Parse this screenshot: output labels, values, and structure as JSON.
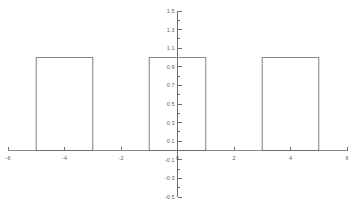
{
  "chart_data": {
    "type": "line",
    "title": "",
    "subtitle": "",
    "xlabel": "",
    "ylabel": "",
    "xlim": [
      -6,
      6
    ],
    "ylim": [
      -0.5,
      1.5
    ],
    "grid": false,
    "legend": null,
    "x_ticks": [
      -6,
      -4,
      -2,
      0,
      2,
      4,
      6
    ],
    "x_tick_labels": [
      "-6",
      "-4",
      "-2",
      "0",
      "2",
      "4",
      "6"
    ],
    "y_ticks": [
      -0.5,
      -0.3,
      -0.1,
      0.1,
      0.3,
      0.5,
      0.7,
      0.9,
      1.1,
      1.3,
      1.5
    ],
    "y_tick_labels": [
      "-0.5",
      "-0.3",
      "-0.1",
      "0.1",
      "0.3",
      "0.5",
      "0.7",
      "0.9",
      "1.1",
      "1.3",
      "1.5"
    ],
    "y_minor_ticks": [
      -0.4,
      -0.2,
      0.0,
      0.2,
      0.4,
      0.6,
      0.8,
      1.0,
      1.2,
      1.4
    ],
    "x_minor_ticks": [
      -5,
      -3,
      -1,
      1,
      3,
      5
    ],
    "series": [
      {
        "name": "periodic-square-pulse-train",
        "color": "#8a8a8a",
        "description": "rectangular pulse train, amplitude 1, pulse width 2, period 4",
        "points": [
          [
            -6,
            0
          ],
          [
            -5,
            0
          ],
          [
            -5,
            1
          ],
          [
            -3,
            1
          ],
          [
            -3,
            0
          ],
          [
            -1,
            0
          ],
          [
            -1,
            1
          ],
          [
            1,
            1
          ],
          [
            1,
            0
          ],
          [
            3,
            0
          ],
          [
            3,
            1
          ],
          [
            5,
            1
          ],
          [
            5,
            0
          ],
          [
            6,
            0
          ]
        ],
        "pulses": [
          {
            "start": -5,
            "end": -3,
            "amplitude": 1
          },
          {
            "start": -1,
            "end": 1,
            "amplitude": 1
          },
          {
            "start": 3,
            "end": 5,
            "amplitude": 1
          }
        ]
      }
    ],
    "colors": {
      "axis": "#6e6e6e",
      "series": "#8a8a8a",
      "tick_text": "#5a5a5a",
      "background": "#ffffff"
    }
  }
}
